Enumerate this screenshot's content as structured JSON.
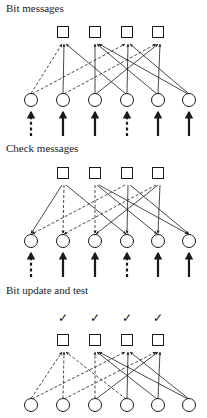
{
  "figure": {
    "width": 207,
    "height": 418,
    "background": "#ffffff",
    "ink_color": "#1a1a1a"
  },
  "panels": [
    {
      "id": "bit-messages",
      "title": "Bit messages",
      "title_x": 6,
      "title_y": 12,
      "direction": "variable-to-check",
      "check_row_y": 32,
      "bit_row_y": 100,
      "input_arrows": {
        "present": true,
        "y_tail": 136,
        "y_head": 112,
        "styles": [
          "dashed",
          "solid",
          "solid",
          "dashed",
          "solid",
          "solid"
        ]
      },
      "checkmarks": {
        "present": false,
        "symbol": "",
        "y": 0
      },
      "edges": [
        {
          "bit": 0,
          "check": 0,
          "style": "dashed"
        },
        {
          "bit": 0,
          "check": 2,
          "style": "dashed"
        },
        {
          "bit": 1,
          "check": 0,
          "style": "solid"
        },
        {
          "bit": 1,
          "check": 3,
          "style": "dashed"
        },
        {
          "bit": 2,
          "check": 1,
          "style": "solid"
        },
        {
          "bit": 2,
          "check": 3,
          "style": "solid"
        },
        {
          "bit": 3,
          "check": 0,
          "style": "solid"
        },
        {
          "bit": 3,
          "check": 2,
          "style": "solid"
        },
        {
          "bit": 4,
          "check": 1,
          "style": "solid"
        },
        {
          "bit": 4,
          "check": 3,
          "style": "solid"
        },
        {
          "bit": 5,
          "check": 1,
          "style": "solid"
        },
        {
          "bit": 5,
          "check": 2,
          "style": "solid"
        }
      ]
    },
    {
      "id": "check-messages",
      "title": "Check messages",
      "title_x": 6,
      "title_y": 152,
      "direction": "check-to-variable",
      "check_row_y": 173,
      "bit_row_y": 241,
      "input_arrows": {
        "present": true,
        "y_tail": 277,
        "y_head": 253,
        "styles": [
          "dashed",
          "solid",
          "solid",
          "dashed",
          "solid",
          "solid"
        ]
      },
      "checkmarks": {
        "present": false,
        "symbol": "",
        "y": 0
      },
      "edges": [
        {
          "bit": 0,
          "check": 0,
          "style": "solid"
        },
        {
          "bit": 0,
          "check": 2,
          "style": "dashed"
        },
        {
          "bit": 1,
          "check": 0,
          "style": "dashed"
        },
        {
          "bit": 1,
          "check": 3,
          "style": "dashed"
        },
        {
          "bit": 2,
          "check": 1,
          "style": "dashed"
        },
        {
          "bit": 2,
          "check": 3,
          "style": "solid"
        },
        {
          "bit": 3,
          "check": 0,
          "style": "solid"
        },
        {
          "bit": 3,
          "check": 2,
          "style": "solid"
        },
        {
          "bit": 4,
          "check": 1,
          "style": "solid"
        },
        {
          "bit": 4,
          "check": 3,
          "style": "solid"
        },
        {
          "bit": 5,
          "check": 1,
          "style": "solid"
        },
        {
          "bit": 5,
          "check": 2,
          "style": "solid"
        }
      ]
    },
    {
      "id": "bit-update-and-test",
      "title": "Bit update and test",
      "title_x": 6,
      "title_y": 294,
      "direction": "variable-to-check",
      "check_row_y": 340,
      "bit_row_y": 405,
      "input_arrows": {
        "present": false,
        "y_tail": 0,
        "y_head": 0,
        "styles": []
      },
      "checkmarks": {
        "present": true,
        "symbol": "✓",
        "y": 318
      },
      "edges": [
        {
          "bit": 0,
          "check": 0,
          "style": "dashed"
        },
        {
          "bit": 0,
          "check": 2,
          "style": "dashed"
        },
        {
          "bit": 1,
          "check": 0,
          "style": "dashed"
        },
        {
          "bit": 1,
          "check": 3,
          "style": "dashed"
        },
        {
          "bit": 2,
          "check": 1,
          "style": "dashed"
        },
        {
          "bit": 2,
          "check": 3,
          "style": "solid"
        },
        {
          "bit": 3,
          "check": 0,
          "style": "dashed"
        },
        {
          "bit": 3,
          "check": 2,
          "style": "solid"
        },
        {
          "bit": 4,
          "check": 1,
          "style": "solid"
        },
        {
          "bit": 4,
          "check": 3,
          "style": "solid"
        },
        {
          "bit": 5,
          "check": 1,
          "style": "solid"
        },
        {
          "bit": 5,
          "check": 2,
          "style": "solid"
        }
      ]
    }
  ],
  "nodes": {
    "check_nodes": {
      "count": 4,
      "shape": "square",
      "size": 11,
      "x_positions": [
        63,
        95,
        127,
        158
      ],
      "labels": [
        "c1",
        "c2",
        "c3",
        "c4"
      ]
    },
    "bit_nodes": {
      "count": 6,
      "shape": "circle",
      "radius": 6.5,
      "x_positions": [
        31,
        63,
        95,
        127,
        158,
        189
      ],
      "labels": [
        "b1",
        "b2",
        "b3",
        "b4",
        "b5",
        "b6"
      ]
    }
  },
  "style": {
    "solid_dash": "none",
    "dashed_dash": "3,2",
    "edge_width": 0.8,
    "node_width": 1.0,
    "arrow_width": 2.2
  }
}
